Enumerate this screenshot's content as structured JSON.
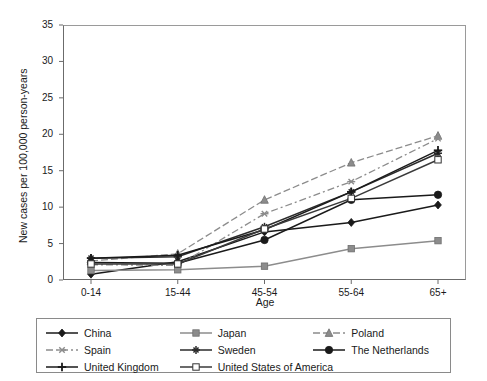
{
  "chart_data": {
    "type": "line",
    "title": "",
    "xlabel": "Age",
    "ylabel": "New cases per 100,000 person-years",
    "categories": [
      "0-14",
      "15-44",
      "45-54",
      "55-64",
      "65+"
    ],
    "ylim": [
      0,
      35
    ],
    "yticks": [
      0,
      5,
      10,
      15,
      20,
      25,
      30,
      35
    ],
    "grid": false,
    "legend_position": "bottom",
    "series": [
      {
        "name": "China",
        "marker": "diamond-filled",
        "color": "#1a1a1a",
        "line": "solid",
        "values": [
          0.8,
          2.5,
          6.6,
          7.9,
          10.3
        ]
      },
      {
        "name": "Japan",
        "marker": "square-gray",
        "color": "#8c8c8c",
        "line": "solid",
        "values": [
          1.3,
          1.4,
          1.9,
          4.3,
          5.4
        ]
      },
      {
        "name": "Poland",
        "marker": "triangle-gray",
        "color": "#8c8c8c",
        "line": "dashed",
        "values": [
          2.6,
          3.6,
          11.0,
          16.1,
          19.8
        ]
      },
      {
        "name": "Spain",
        "marker": "x-gray",
        "color": "#8c8c8c",
        "line": "dashdot",
        "values": [
          2.1,
          2.0,
          9.1,
          13.5,
          19.4
        ]
      },
      {
        "name": "Sweden",
        "marker": "star-black",
        "color": "#2b2b2b",
        "line": "solid",
        "values": [
          3.0,
          3.2,
          7.3,
          12.1,
          17.4
        ]
      },
      {
        "name": "The Netherlands",
        "marker": "circle-filled",
        "color": "#1a1a1a",
        "line": "solid",
        "values": [
          2.4,
          2.3,
          5.5,
          11.0,
          11.7
        ]
      },
      {
        "name": "United Kingdom",
        "marker": "plus-black",
        "color": "#1a1a1a",
        "line": "solid",
        "values": [
          3.0,
          3.4,
          6.9,
          12.1,
          17.8
        ]
      },
      {
        "name": "United States of America",
        "marker": "square-open",
        "color": "#3a3a3a",
        "line": "solid",
        "values": [
          2.2,
          2.2,
          7.0,
          11.2,
          16.5
        ]
      }
    ]
  },
  "legend": {
    "items": [
      {
        "label": "China"
      },
      {
        "label": "Japan"
      },
      {
        "label": "Poland"
      },
      {
        "label": "Spain"
      },
      {
        "label": "Sweden"
      },
      {
        "label": "The Netherlands"
      },
      {
        "label": "United Kingdom"
      },
      {
        "label": "United States of America"
      }
    ]
  }
}
